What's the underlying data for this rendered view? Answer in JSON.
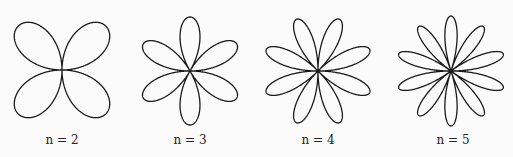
{
  "figures": [
    {
      "label": "n = 2",
      "n": 2,
      "petals": 4,
      "cx": 62,
      "cy": 70,
      "r": 62,
      "rotation_deg": 45
    },
    {
      "label": "n = 3",
      "n": 3,
      "petals": 6,
      "cx": 190,
      "cy": 71,
      "r": 54,
      "rotation_deg": 90
    },
    {
      "label": "n = 4",
      "n": 4,
      "petals": 8,
      "cx": 318,
      "cy": 71,
      "r": 56,
      "rotation_deg": 67.5
    },
    {
      "label": "n = 5",
      "n": 5,
      "petals": 10,
      "cx": 451,
      "cy": 71,
      "r": 55,
      "rotation_deg": 90
    }
  ],
  "stroke_color": "#1a1a1a"
}
